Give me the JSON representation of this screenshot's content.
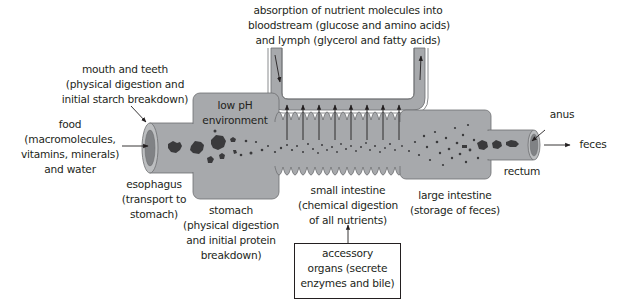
{
  "diagram": {
    "colors": {
      "tube_fill": "#a7a9ac",
      "tube_stroke": "#6d6e71",
      "lumen_inner": "#808285",
      "particles": "#3a3a3c",
      "arrows": "#231f20",
      "text": "#231f20"
    },
    "labels": {
      "absorption": "absorption of nutrient molecules into\nbloodstream (glucose and amino acids)\nand lymph (glycerol and fatty acids)",
      "mouth": "mouth and teeth\n(physical digestion and\ninitial starch breakdown)",
      "food": "food\n(macromolecules,\nvitamins, minerals)\nand water",
      "low_ph": "low pH\nenvironment",
      "esophagus": "esophagus\n(transport to\nstomach)",
      "stomach": "stomach\n(physical digestion\nand initial protein\nbreakdown)",
      "small_intestine": "small intestine\n(chemical digestion\nof all nutrients)",
      "large_intestine": "large intestine\n(storage of feces)",
      "rectum": "rectum",
      "anus": "anus",
      "feces": "feces",
      "accessory": "accessory\norgans (secrete\nenzymes and bile)"
    }
  }
}
